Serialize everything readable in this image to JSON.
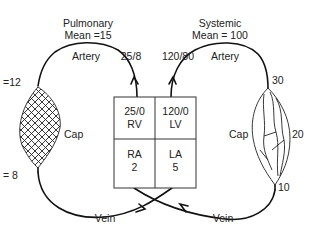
{
  "diagram": {
    "pulmonary": {
      "title": "Pulmonary",
      "mean": "Mean =15",
      "artery_label": "Artery",
      "artery_pressure": "25/8",
      "cap_label": "Cap",
      "cap_in_pressure": "=12",
      "cap_out_pressure": "= 8",
      "vein_label": "Vein"
    },
    "systemic": {
      "title": "Systemic",
      "mean": "Mean = 100",
      "artery_label": "Artery",
      "artery_pressure": "120/80",
      "cap_label": "Cap",
      "cap_in_pressure": "30",
      "cap_mid_pressure": "20",
      "cap_out_pressure": "10",
      "vein_label": "Vein"
    },
    "heart": {
      "rv": {
        "pressure": "25/0",
        "name": "RV"
      },
      "lv": {
        "pressure": "120/0",
        "name": "LV"
      },
      "ra": {
        "name": "RA",
        "pressure": "2"
      },
      "la": {
        "name": "LA",
        "pressure": "5"
      }
    }
  }
}
